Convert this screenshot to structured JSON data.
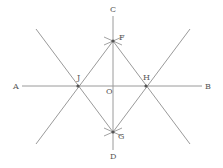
{
  "diagram": {
    "type": "geometric-construction",
    "colors": {
      "line": "#9a9a9a",
      "point": "#555555",
      "label": "#555555",
      "background": "#ffffff"
    },
    "points": {
      "A": {
        "label": "A",
        "x": 22,
        "y": 86
      },
      "B": {
        "label": "B",
        "x": 202,
        "y": 86
      },
      "C": {
        "label": "C",
        "x": 113,
        "y": 16
      },
      "D": {
        "label": "D",
        "x": 113,
        "y": 150
      },
      "F": {
        "label": "F",
        "x": 113,
        "y": 41
      },
      "G": {
        "label": "G",
        "x": 113,
        "y": 132
      },
      "J": {
        "label": "J",
        "x": 78,
        "y": 86
      },
      "H": {
        "label": "H",
        "x": 146,
        "y": 86
      },
      "O": {
        "label": "O",
        "x": 113,
        "y": 86
      }
    },
    "labels": [
      {
        "id": "A",
        "text": "A",
        "x": 13,
        "y": 89
      },
      {
        "id": "B",
        "text": "B",
        "x": 205,
        "y": 89
      },
      {
        "id": "C",
        "text": "C",
        "x": 110,
        "y": 12
      },
      {
        "id": "D",
        "text": "D",
        "x": 110,
        "y": 159
      },
      {
        "id": "F",
        "text": "F",
        "x": 119,
        "y": 40
      },
      {
        "id": "G",
        "text": "G",
        "x": 118,
        "y": 139
      },
      {
        "id": "J",
        "text": "J",
        "x": 77,
        "y": 80
      },
      {
        "id": "H",
        "text": "H",
        "x": 143,
        "y": 80
      },
      {
        "id": "O",
        "text": "O",
        "x": 106,
        "y": 94
      }
    ],
    "segments": [
      {
        "name": "AB",
        "from": "A",
        "to": "B"
      },
      {
        "name": "CD",
        "from": "C",
        "to": "D"
      },
      {
        "name": "line-through-G-J",
        "x1": 36,
        "y1": 29,
        "x2": 113,
        "y2": 132
      },
      {
        "name": "line-through-G-H",
        "x1": 190,
        "y1": 29,
        "x2": 113,
        "y2": 132
      },
      {
        "name": "line-through-F-J",
        "x1": 113,
        "y1": 41,
        "x2": 36,
        "y2": 144
      },
      {
        "name": "line-through-F-H",
        "x1": 113,
        "y1": 41,
        "x2": 190,
        "y2": 144
      }
    ]
  }
}
